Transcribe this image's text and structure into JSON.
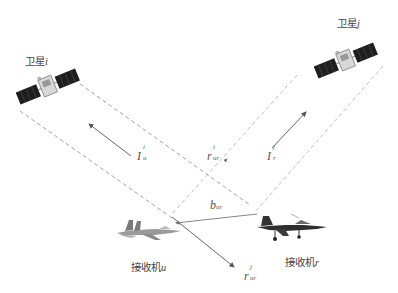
{
  "diagram": {
    "type": "geometry-schematic",
    "satellites": [
      {
        "id": "sat-i",
        "label_cn": "卫星",
        "label_var": "i"
      },
      {
        "id": "sat-j",
        "label_cn": "卫星",
        "label_var": "j"
      }
    ],
    "receivers": [
      {
        "id": "recv-u",
        "label_cn": "接收机",
        "label_var": "u"
      },
      {
        "id": "recv-r",
        "label_cn": "接收机",
        "label_var": "r"
      }
    ],
    "vectors": {
      "I_u": {
        "base": "I",
        "sup": "i",
        "sub": "u"
      },
      "I_r": {
        "base": "I",
        "sup": "j",
        "sub": "r"
      },
      "r_ur_i": {
        "base": "r",
        "sup": "i",
        "sub": "ur"
      },
      "r_ur_j": {
        "base": "r",
        "sup": "j",
        "sub": "ur"
      },
      "b_ur": {
        "base": "b",
        "sub": "ur"
      }
    },
    "colors": {
      "line": "#8a8a8a",
      "arrow": "#555555",
      "panel": "#1e1e1e",
      "text": "#444444"
    }
  }
}
